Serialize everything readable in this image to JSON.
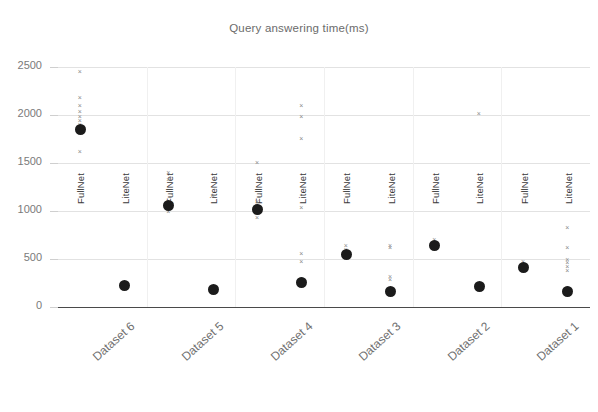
{
  "chart_data": {
    "type": "scatter",
    "title": "Query answering time(ms)",
    "xlabel": "",
    "ylabel": "",
    "ylim": [
      0,
      2500
    ],
    "yticks": [
      0,
      500,
      1000,
      1500,
      2000,
      2500
    ],
    "ytick_labels": [
      "0",
      "500",
      "1000",
      "1500",
      "2000",
      "2500"
    ],
    "grid": true,
    "legend": "none",
    "categories": [
      "Dataset 6",
      "Dataset 5",
      "Dataset 4",
      "Dataset 3",
      "Dataset 2",
      "Dataset 1"
    ],
    "group_labels": [
      "FullNet",
      "LiteNet"
    ],
    "series": [
      {
        "name": "FullNet",
        "values": [
          1850,
          1060,
          1020,
          545,
          640,
          415
        ]
      },
      {
        "name": "LiteNet",
        "values": [
          220,
          180,
          255,
          160,
          215,
          165
        ]
      }
    ],
    "panels": [
      {
        "category": "Dataset 6",
        "series_name": "FullNet",
        "mean": 1850,
        "observations": [
          2450,
          2180,
          2100,
          2035,
          1985,
          1945,
          1905,
          1860,
          1820,
          1620
        ]
      },
      {
        "category": "Dataset 6",
        "series_name": "LiteNet",
        "mean": 220,
        "observations": [
          260,
          230,
          215,
          205,
          190
        ]
      },
      {
        "category": "Dataset 5",
        "series_name": "FullNet",
        "mean": 1060,
        "observations": [
          1400,
          1330,
          1090,
          1060,
          1030,
          1000
        ]
      },
      {
        "category": "Dataset 5",
        "series_name": "LiteNet",
        "mean": 180,
        "observations": [
          1160,
          205,
          185,
          175,
          165
        ]
      },
      {
        "category": "Dataset 4",
        "series_name": "FullNet",
        "mean": 1020,
        "observations": [
          1510,
          1100,
          1060,
          1030,
          1000,
          975,
          930
        ]
      },
      {
        "category": "Dataset 4",
        "series_name": "LiteNet",
        "mean": 255,
        "observations": [
          2100,
          1980,
          1760,
          1040,
          560,
          470,
          300,
          265,
          240
        ]
      },
      {
        "category": "Dataset 3",
        "series_name": "FullNet",
        "mean": 545,
        "observations": [
          640,
          600,
          570,
          550,
          535,
          520
        ]
      },
      {
        "category": "Dataset 3",
        "series_name": "LiteNet",
        "mean": 160,
        "observations": [
          640,
          620,
          320,
          290,
          185,
          170,
          155
        ]
      },
      {
        "category": "Dataset 2",
        "series_name": "FullNet",
        "mean": 640,
        "observations": [
          700,
          670,
          650,
          640,
          630,
          615
        ]
      },
      {
        "category": "Dataset 2",
        "series_name": "LiteNet",
        "mean": 215,
        "observations": [
          2020,
          250,
          230,
          215,
          200,
          190
        ]
      },
      {
        "category": "Dataset 1",
        "series_name": "FullNet",
        "mean": 415,
        "observations": [
          470,
          445,
          425,
          415,
          400,
          390
        ]
      },
      {
        "category": "Dataset 1",
        "series_name": "LiteNet",
        "mean": 165,
        "observations": [
          830,
          620,
          500,
          460,
          420,
          380,
          200,
          175,
          160
        ]
      }
    ]
  },
  "colors": {
    "mean_marker": "#1b1b1b",
    "observation_marker": "#8a8a8a",
    "gridline": "#e2e2e2",
    "axis_line": "#4a4a4a",
    "title_text": "#6b6b6b",
    "tick_text": "#7a7a7a",
    "background": "#ffffff"
  }
}
